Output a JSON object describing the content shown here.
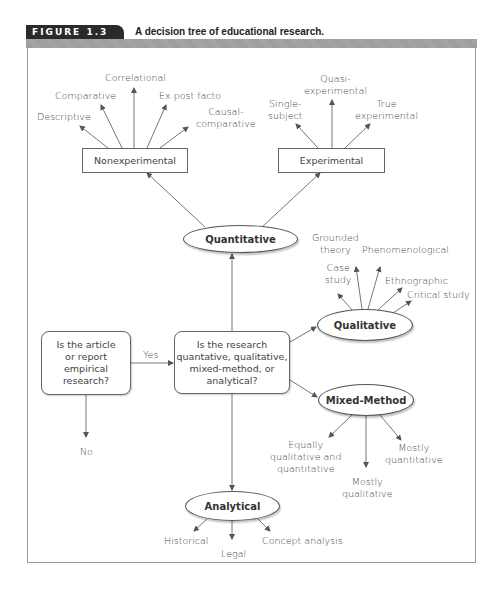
{
  "figure": {
    "label": "FIGURE 1.3",
    "title": "A decision tree of educational research."
  },
  "nodes": {
    "start": "Is the article or report empirical research?",
    "start_lines": [
      "Is the article",
      "or report empirical",
      "research?"
    ],
    "yes": "Yes",
    "no": "No",
    "question": "Is the research quantative, qualitative, mixed-method, or analytical?",
    "question_lines": [
      "Is the research",
      "quantative, qualitative,",
      "mixed-method, or",
      "analytical?"
    ],
    "quantitative": "Quantitative",
    "qualitative": "Qualitative",
    "mixed": "Mixed-Method",
    "analytical": "Analytical",
    "nonexperimental": "Nonexperimental",
    "experimental": "Experimental"
  },
  "nonexperimental_children": {
    "descriptive": "Descriptive",
    "comparative": "Comparative",
    "correlational": "Correlational",
    "ex_post_facto": "Ex post facto",
    "causal_1": "Causal-",
    "causal_2": "comparative"
  },
  "experimental_children": {
    "single_1": "Single-",
    "single_2": "subject",
    "quasi_1": "Quasi-",
    "quasi_2": "experimental",
    "true_1": "True",
    "true_2": "experimental"
  },
  "qualitative_children": {
    "case_1": "Case",
    "case_2": "study",
    "grounded_1": "Grounded",
    "grounded_2": "theory",
    "phenomenological": "Phenomenological",
    "ethnographic": "Ethnographic",
    "critical": "Critical study"
  },
  "mixed_children": {
    "equal_1": "Equally",
    "equal_2": "qualitative and",
    "equal_3": "quantitative",
    "mostly_qual_1": "Mostly",
    "mostly_qual_2": "qualitative",
    "mostly_quant_1": "Mostly",
    "mostly_quant_2": "quantitative"
  },
  "analytical_children": {
    "historical": "Historical",
    "legal": "Legal",
    "concept": "Concept analysis"
  }
}
